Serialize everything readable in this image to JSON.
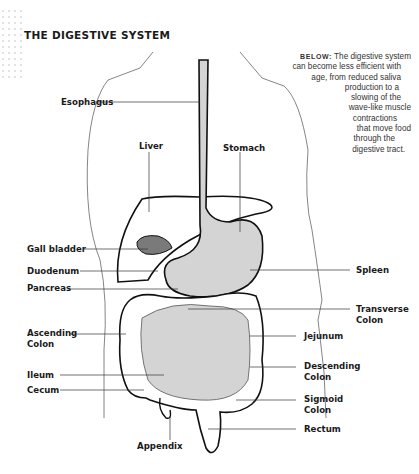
{
  "title": "THE DIGESTIVE SYSTEM",
  "caption": {
    "keyword": "BELOW:",
    "lines": [
      " The digestive system",
      "can become less efficient with",
      "age, from reduced saliva",
      "production to a",
      "slowing of the",
      "wave-like muscle",
      "contractions",
      "that move food",
      "through the",
      "digestive tract."
    ]
  },
  "labels": {
    "esophagus": "Esophagus",
    "liver": "Liver",
    "stomach": "Stomach",
    "gall_bladder": "Gall bladder",
    "duodenum": "Duodenum",
    "pancreas": "Pancreas",
    "spleen": "Spleen",
    "transverse_colon_1": "Transverse",
    "transverse_colon_2": "Colon",
    "ascending_colon_1": "Ascending",
    "ascending_colon_2": "Colon",
    "jejunum": "Jejunum",
    "descending_colon_1": "Descending",
    "descending_colon_2": "Colon",
    "ileum": "Ileum",
    "cecum": "Cecum",
    "sigmoid_colon_1": "Sigmoid",
    "sigmoid_colon_2": "Colon",
    "rectum": "Rectum",
    "appendix": "Appendix"
  },
  "colors": {
    "organ_fill": "#d4d4d4",
    "gall_bladder_fill": "#7a7a7a",
    "outline": "#111111",
    "body_outline": "#555555"
  }
}
